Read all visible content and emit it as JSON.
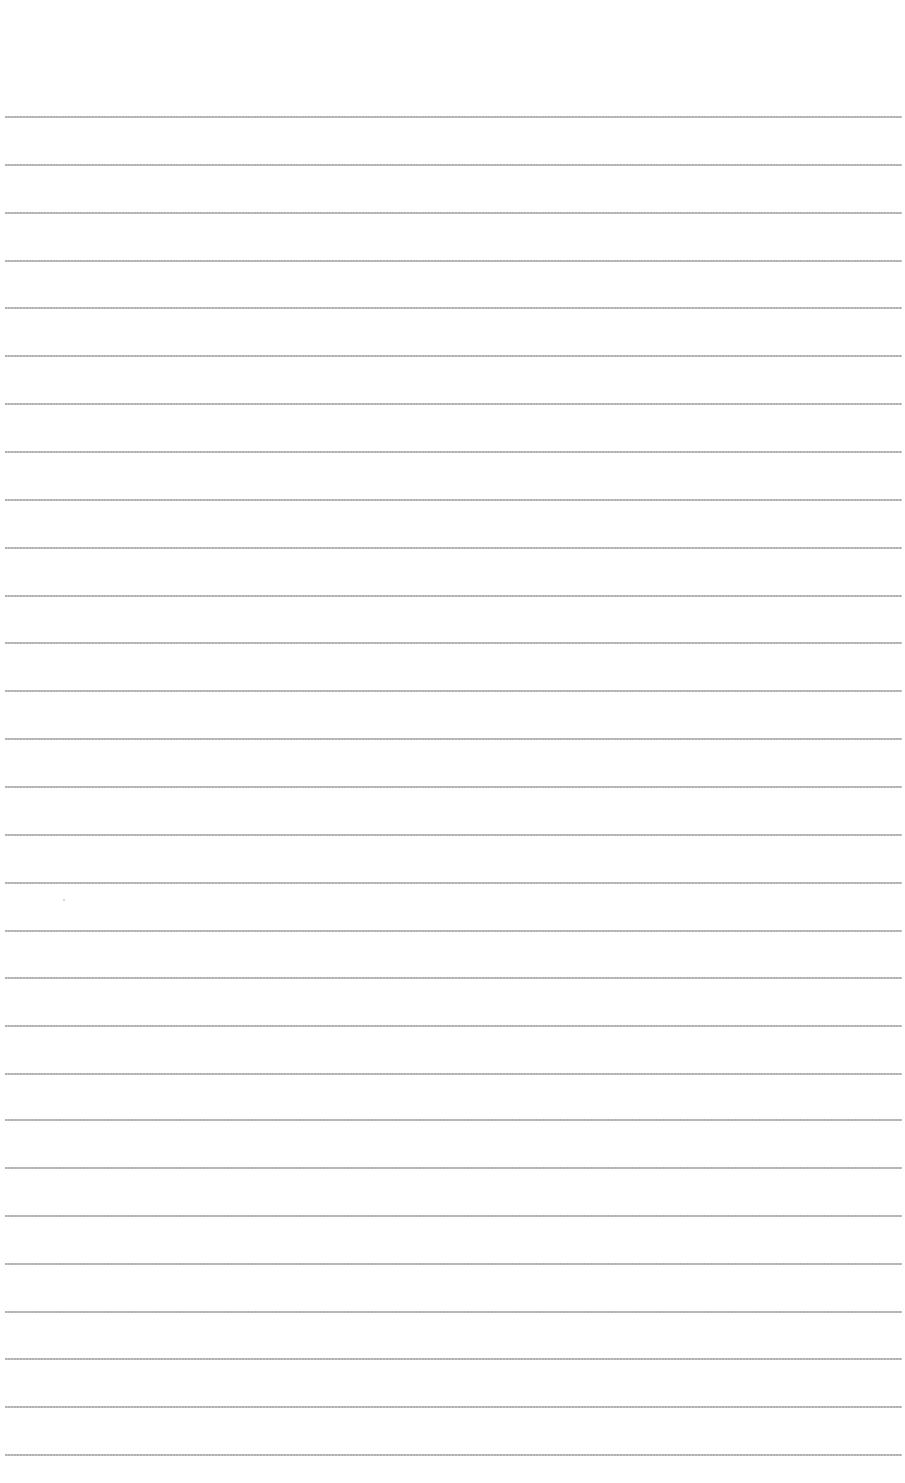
{
  "page": {
    "type": "blank lined paper",
    "background_color": "#ffffff",
    "line_color": "#aaaaaa",
    "line_count": 29,
    "first_line_y": 116,
    "line_spacing": 47.86,
    "line_left": 5,
    "line_right_margin": 3
  }
}
